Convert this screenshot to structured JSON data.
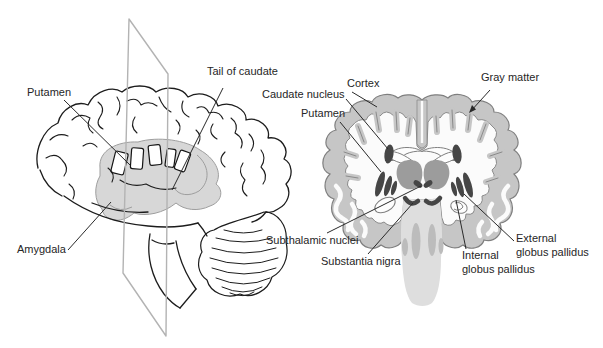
{
  "figure": {
    "colors": {
      "background": "#ffffff",
      "ink": "#1c1c1c",
      "plane_gray": "#b3b3b3",
      "cortex_gray": "#c6c6c6",
      "outline_gray": "#7f7f7f",
      "nuclei_dark": "#464646",
      "thalamus_gray": "#9c9c9c",
      "brainstem_gray": "#dedede",
      "tract_gray": "#bcbcbc",
      "overlay_gray": "#d0d0d0"
    },
    "labels": {
      "putamen_left": "Putamen",
      "tail_of_caudate": "Tail of caudate",
      "amygdala": "Amygdala",
      "cortex": "Cortex",
      "gray_matter": "Gray matter",
      "caudate_nucleus": "Caudate nucleus",
      "putamen_right": "Putamen",
      "subthalamic_nuclei": "Subthalamic nuclei",
      "substantia_nigra": "Substantia nigra",
      "internal_globus_pallidus": "Internal\nglobus pallidus",
      "external_globus_pallidus": "External\nglobus pallidus"
    }
  }
}
